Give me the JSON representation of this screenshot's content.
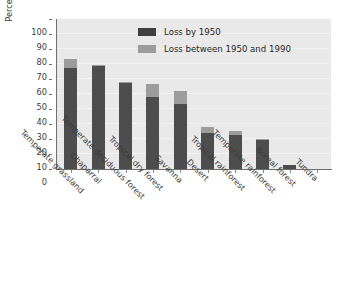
{
  "chart_data": {
    "type": "bar",
    "stacked": true,
    "title": "",
    "xlabel": "",
    "ylabel": "Percent of habitat lost",
    "ylim": [
      0,
      100
    ],
    "ytick_step": 10,
    "ytick_labels": [
      "100",
      "90",
      "80",
      "70",
      "60",
      "50",
      "40",
      "30",
      "20",
      "10",
      "0"
    ],
    "grid": true,
    "grid_axis": "y",
    "legend_position": "top-center",
    "categories": [
      "Temperate grassland",
      "Chaparral",
      "Temperate deciduous forest",
      "Tropical dry forest",
      "Savanna",
      "Desert",
      "Tropical rainforest",
      "Temperate rainforest",
      "Boreal forest",
      "Tundra"
    ],
    "series": [
      {
        "name": "Loss by 1950",
        "color": "#4d4d4d",
        "values": [
          67,
          68.5,
          57,
          48,
          43,
          24,
          22.5,
          19.5,
          2.5,
          0
        ]
      },
      {
        "name": "Loss between 1950 and 1990",
        "color": "#9c9c9c",
        "values": [
          6,
          0.5,
          0.5,
          8.5,
          9,
          4,
          2.5,
          0.5,
          0,
          0
        ]
      }
    ],
    "totals": [
      73,
      69,
      57.5,
      56.5,
      52,
      28,
      25,
      20,
      2.5,
      0
    ],
    "colors": {
      "plot_background": "#e9e9e9",
      "gridline": "#f3f3f3",
      "axis": "#6e6e6e",
      "dark_series": "#4d4d4d",
      "light_series": "#9c9c9c",
      "text": "#3b3b3b"
    }
  },
  "legend": {
    "items": [
      {
        "label": "Loss by 1950",
        "swatch": "dark"
      },
      {
        "label": "Loss between 1950 and 1990",
        "swatch": "light"
      }
    ]
  }
}
